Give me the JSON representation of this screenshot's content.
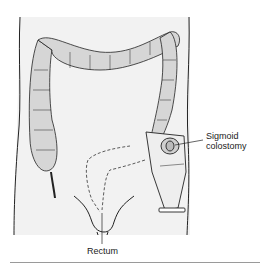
{
  "labels": {
    "sigmoid_colostomy_line1": "Sigmoid",
    "sigmoid_colostomy_line2": "colostomy",
    "rectum": "Rectum"
  },
  "colors": {
    "body_fill": "#f2f2f2",
    "colon_fill": "#d6d6d6",
    "outline": "#222222",
    "rule": "#9a9a9a"
  }
}
